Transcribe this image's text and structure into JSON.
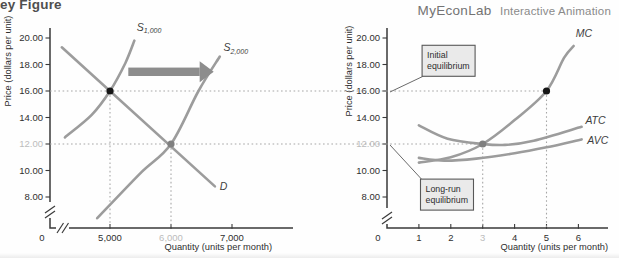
{
  "page": {
    "title_partial": "ey Figure",
    "brand": "MyEconLab",
    "brand_suffix": "Interactive Animation"
  },
  "colors": {
    "curve": "#9c9c9c",
    "axis": "#3a3a3a",
    "dotted": "#a6a6a6",
    "dot_initial": "#161616",
    "dot_longrun": "#7f7f7f",
    "tick_label": "#2f2f2f",
    "tick_label_dim": "#bcbcbc",
    "curve_label": "#3d3d3d",
    "arrow": "#8d8d8d",
    "callout_fill": "#eaeaea",
    "callout_border": "#585858",
    "leader": "#6a6a6a"
  },
  "chart_data": [
    {
      "id": "market",
      "type": "line",
      "xlabel": "Quantity (units per month)",
      "ylabel": "Price (dollars per unit)",
      "x_unit": "thousands of units",
      "ylim": [
        8,
        20
      ],
      "grid": false,
      "axis_break_x": true,
      "axis_break_y": true,
      "x_ticks": [
        {
          "value": 0,
          "label": "0"
        },
        {
          "value": 5,
          "label": "5,000"
        },
        {
          "value": 6,
          "label": "6,000",
          "dim": true
        },
        {
          "value": 7,
          "label": "7,000"
        }
      ],
      "y_ticks": [
        {
          "value": 20,
          "label": "20.00"
        },
        {
          "value": 18,
          "label": "18.00"
        },
        {
          "value": 16,
          "label": "16.00"
        },
        {
          "value": 14,
          "label": "14.00"
        },
        {
          "value": 12,
          "label": "12.00",
          "dim": true
        },
        {
          "value": 10,
          "label": "10.00"
        },
        {
          "value": 8,
          "label": "8.00"
        }
      ],
      "series": [
        {
          "name": "supply-initial",
          "label_main": "S",
          "label_sub": "1,000",
          "label_at": [
            5.44,
            20.55
          ],
          "points": [
            [
              4.26,
              12.5
            ],
            [
              4.7,
              14.2
            ],
            [
              5,
              16
            ],
            [
              5.25,
              18.1
            ],
            [
              5.4,
              19.8
            ]
          ]
        },
        {
          "name": "supply-new",
          "label_main": "S",
          "label_sub": "2,000",
          "label_at": [
            6.86,
            19.0
          ],
          "points": [
            [
              4.79,
              6.4
            ],
            [
              5.5,
              9.8
            ],
            [
              6,
              12
            ],
            [
              6.45,
              16
            ],
            [
              6.8,
              18.6
            ]
          ]
        },
        {
          "name": "demand",
          "label_main": "D",
          "label_sub": "",
          "label_at": [
            6.8,
            8.55
          ],
          "points": [
            [
              4.21,
              19.3
            ],
            [
              6.72,
              8.8
            ]
          ]
        }
      ],
      "equilibria": [
        {
          "name": "market-initial-equilibrium-point",
          "x": 5,
          "y": 16,
          "style": "initial"
        },
        {
          "name": "market-long-run-equilibrium-point",
          "x": 6,
          "y": 12,
          "style": "longrun"
        }
      ],
      "guides": [
        {
          "x": 5,
          "from_y": 16
        },
        {
          "x": 6,
          "from_y": 12
        }
      ],
      "arrow": {
        "name": "supply-shift-arrow",
        "from_x": 5.3,
        "to_x": 6.7,
        "y": 17.45
      }
    },
    {
      "id": "firm",
      "type": "line",
      "xlabel": "Quantity (units per month)",
      "ylabel": "Price (dollars per unit)",
      "ylim": [
        8,
        20
      ],
      "grid": false,
      "axis_break_x": false,
      "axis_break_y": true,
      "x_ticks": [
        {
          "value": 0,
          "label": "0"
        },
        {
          "value": 1,
          "label": "1"
        },
        {
          "value": 2,
          "label": "2"
        },
        {
          "value": 3,
          "label": "3",
          "dim": true
        },
        {
          "value": 4,
          "label": "4"
        },
        {
          "value": 5,
          "label": "5"
        },
        {
          "value": 6,
          "label": "6"
        }
      ],
      "y_ticks": [
        {
          "value": 20,
          "label": "20.00"
        },
        {
          "value": 18,
          "label": "18.00"
        },
        {
          "value": 16,
          "label": "16.00"
        },
        {
          "value": 14,
          "label": "14.00"
        },
        {
          "value": 12,
          "label": "12.00",
          "dim": true
        },
        {
          "value": 10,
          "label": "10.00"
        },
        {
          "value": 8,
          "label": "8.00"
        }
      ],
      "series": [
        {
          "name": "marginal-cost",
          "label_main": "MC",
          "label_sub": "",
          "label_at": [
            5.92,
            20.1
          ],
          "points": [
            [
              1,
              10.6
            ],
            [
              2,
              11.0
            ],
            [
              3,
              12.0
            ],
            [
              4,
              13.8
            ],
            [
              5,
              16
            ],
            [
              5.55,
              18.5
            ],
            [
              5.85,
              19.4
            ]
          ]
        },
        {
          "name": "average-total-cost",
          "label_main": "ATC",
          "label_sub": "",
          "label_at": [
            6.22,
            13.5
          ],
          "points": [
            [
              1,
              13.4
            ],
            [
              1.9,
              12.4
            ],
            [
              3,
              12.0
            ],
            [
              3.7,
              11.93
            ],
            [
              4.6,
              12.25
            ],
            [
              6.1,
              13.3
            ]
          ]
        },
        {
          "name": "average-variable-cost",
          "label_main": "AVC",
          "label_sub": "",
          "label_at": [
            6.28,
            12.0
          ],
          "points": [
            [
              1,
              10.95
            ],
            [
              1.8,
              10.75
            ],
            [
              2.8,
              10.9
            ],
            [
              4,
              11.3
            ],
            [
              5,
              11.75
            ],
            [
              6.1,
              12.35
            ]
          ]
        }
      ],
      "equilibria": [
        {
          "name": "firm-initial-equilibrium-point",
          "x": 5,
          "y": 16,
          "style": "initial"
        },
        {
          "name": "firm-long-run-equilibrium-point",
          "x": 3,
          "y": 12,
          "style": "longrun"
        }
      ],
      "guides": [
        {
          "x": 3,
          "from_y": 12
        },
        {
          "x": 5,
          "from_y": 16
        }
      ],
      "callouts": [
        {
          "name": "initial-equilibrium-callout",
          "lines": [
            "Initial",
            "equilibrium"
          ],
          "at": [
            1.1,
            19.45
          ],
          "leader_from": "bottom-left",
          "leader_to_y": 16
        },
        {
          "name": "long-run-equilibrium-callout",
          "lines": [
            "Long-run",
            "equilibrium"
          ],
          "at": [
            1.05,
            9.35
          ],
          "leader_from": "top-left",
          "leader_to_y": 12
        }
      ]
    }
  ],
  "connectors": [
    {
      "price": 16,
      "to_x_firm": 5
    },
    {
      "price": 12,
      "to_x_firm": 3
    }
  ]
}
